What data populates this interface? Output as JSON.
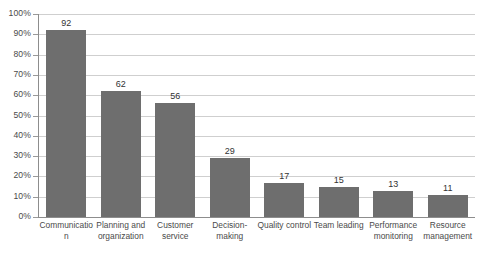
{
  "chart_data": {
    "type": "bar",
    "title": "",
    "xlabel": "",
    "ylabel": "",
    "categories": [
      "Communication",
      "Planning and organization",
      "Customer service",
      "Decision-making",
      "Quality control",
      "Team leading",
      "Performance monitoring",
      "Resource management"
    ],
    "values": [
      92,
      62,
      56,
      29,
      17,
      15,
      13,
      11
    ],
    "value_labels": [
      "92",
      "62",
      "56",
      "29",
      "17",
      "15",
      "13",
      "11"
    ],
    "ylim": [
      0,
      100
    ],
    "ytick_labels": [
      "100%",
      "90%",
      "80%",
      "70%",
      "60%",
      "50%",
      "40%",
      "30%",
      "20%",
      "10%",
      "0%"
    ],
    "ytick_values": [
      100,
      90,
      80,
      70,
      60,
      50,
      40,
      30,
      20,
      10,
      0
    ],
    "grid": true,
    "legend": "none",
    "bar_color": "#6e6e6e",
    "gridline_color": "#cfcfcf",
    "axis_color": "#8d8d8d",
    "background_color": "#ffffff"
  }
}
